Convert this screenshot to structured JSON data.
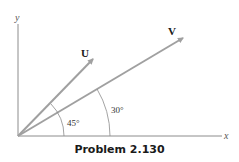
{
  "diagram": {
    "axes": {
      "x_label": "x",
      "y_label": "y"
    },
    "vectors": [
      {
        "name": "U",
        "angle_deg": 45
      },
      {
        "name": "V",
        "angle_deg": 30
      }
    ],
    "angle_labels": {
      "u_angle": "45°",
      "v_angle": "30°"
    },
    "colors": {
      "vector": "#a0a0a0",
      "axis": "#8c8c8c",
      "arc": "#8c8c8c",
      "text": "#1a1a1a"
    }
  },
  "caption": "Problem 2.130"
}
